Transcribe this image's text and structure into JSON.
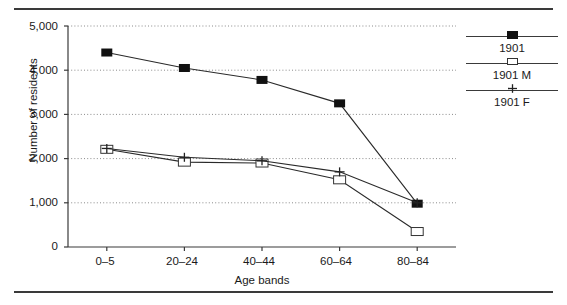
{
  "figure": {
    "has_top_rule": true,
    "has_bottom_rule": true,
    "background": "#ffffff",
    "ink": "#1a1a1a"
  },
  "legend": {
    "position": "right",
    "entries": [
      {
        "label": "1901",
        "marker": "filled-square"
      },
      {
        "label": "1901 M",
        "marker": "open-square"
      },
      {
        "label": "1901 F",
        "marker": "plus"
      }
    ]
  },
  "chart_data": {
    "type": "line",
    "title": "",
    "xlabel": "Age bands",
    "ylabel": "Number of residents",
    "categories": [
      "0–5",
      "20–24",
      "40–44",
      "60–64",
      "80–84"
    ],
    "ylim": [
      0,
      5000
    ],
    "yticks": [
      0,
      1000,
      2000,
      3000,
      4000,
      5000
    ],
    "ytick_labels": [
      "0",
      "1,000",
      "2,000",
      "3,000",
      "4,000",
      "5,000"
    ],
    "grid": "horizontal-dotted",
    "series": [
      {
        "name": "1901",
        "marker": "filled-square",
        "values": [
          4400,
          4050,
          3780,
          3250,
          980
        ]
      },
      {
        "name": "1901 M",
        "marker": "open-square",
        "values": [
          2210,
          1920,
          1900,
          1520,
          350
        ]
      },
      {
        "name": "1901 F",
        "marker": "plus",
        "values": [
          2230,
          2030,
          1950,
          1700,
          1000
        ]
      }
    ]
  }
}
